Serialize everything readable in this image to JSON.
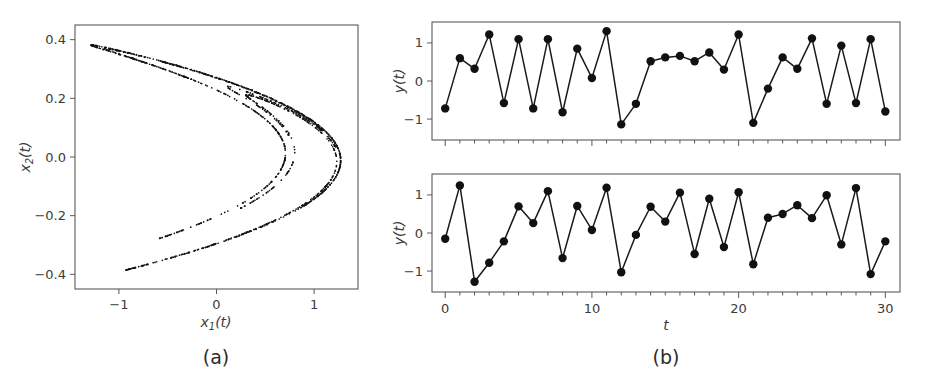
{
  "figure": {
    "background_color": "#ffffff",
    "foreground_color": "#262626",
    "width": 940,
    "height": 378
  },
  "panels": [
    {
      "id": "panel-a",
      "caption": "(a)",
      "type": "scatter",
      "xlabel": "x₁(t)",
      "xlabel_base": "x",
      "xlabel_sub": "1",
      "xlabel_tail": "(t)",
      "ylabel": "x₂(t)",
      "ylabel_base": "x",
      "ylabel_sub": "2",
      "ylabel_tail": "(t)",
      "xticks": [
        -1,
        0,
        1
      ],
      "xtick_labels": [
        "−1",
        "0",
        "1"
      ],
      "yticks": [
        0.4,
        0.2,
        0.0,
        -0.2,
        -0.4
      ],
      "ytick_labels": [
        "0.4",
        "0.2",
        "0.0",
        "−0.2",
        "−0.4"
      ],
      "xlim": [
        -1.45,
        1.45
      ],
      "ylim": [
        -0.45,
        0.45
      ],
      "grid": false,
      "marker": "point",
      "marker_color": "#141414"
    },
    {
      "id": "panel-b",
      "caption": "(b)",
      "type": "line",
      "xlabel": "t",
      "ylabel": "y(t)",
      "xticks": [
        0,
        10,
        20,
        30
      ],
      "xtick_labels": [
        "0",
        "10",
        "20",
        "30"
      ],
      "minor_xticks_every": 1,
      "yticks": [
        1,
        0,
        -1
      ],
      "ytick_labels": [
        "1",
        "0",
        "−1"
      ],
      "xlim": [
        -0.9,
        31.0
      ],
      "ylim": [
        -1.55,
        1.55
      ],
      "grid": false,
      "marker": "circle",
      "marker_color": "#111111",
      "line_color": "#1a1a1a"
    }
  ],
  "chart_data": [
    {
      "type": "scatter",
      "id": "henon-attractor",
      "title": "",
      "panel": "(a)",
      "xlabel": "x_1(t)",
      "ylabel": "x_2(t)",
      "xlim": [
        -1.45,
        1.45
      ],
      "ylim": [
        -0.45,
        0.45
      ],
      "xticks": [
        -1,
        0,
        1
      ],
      "yticks": [
        0.4,
        0.2,
        0.0,
        -0.2,
        -0.4
      ],
      "grid": false,
      "description": "Henon-map chaotic attractor, sideways parabola opening to the left with characteristic folded fractal bands",
      "n_points": 1400,
      "generator": {
        "map": "henon",
        "a": 1.4,
        "b": 0.3,
        "x_scale": 1.0,
        "y_scale": 0.3
      }
    },
    {
      "type": "line",
      "id": "timeseries-top",
      "panel": "(b) top",
      "xlabel": "",
      "ylabel": "y(t)",
      "xlim": [
        -0.9,
        31.0
      ],
      "ylim": [
        -1.55,
        1.55
      ],
      "xticks": [
        0,
        10,
        20,
        30
      ],
      "yticks": [
        1,
        0,
        -1
      ],
      "grid": false,
      "x": [
        0,
        1,
        2,
        3,
        4,
        5,
        6,
        7,
        8,
        9,
        10,
        11,
        12,
        13,
        14,
        15,
        16,
        17,
        18,
        19,
        20,
        21,
        22,
        23,
        24,
        25,
        26,
        27,
        28,
        29,
        30
      ],
      "values": [
        -0.72,
        0.6,
        0.32,
        1.22,
        -0.58,
        1.1,
        -0.72,
        1.1,
        -0.82,
        0.85,
        0.08,
        1.31,
        -1.14,
        -0.6,
        0.52,
        0.62,
        0.66,
        0.52,
        0.75,
        0.3,
        1.22,
        -1.1,
        -0.2,
        0.62,
        0.32,
        1.12,
        -0.6,
        0.93,
        -0.58,
        1.1,
        -0.8
      ]
    },
    {
      "type": "line",
      "id": "timeseries-bottom",
      "panel": "(b) bottom",
      "xlabel": "t",
      "ylabel": "y(t)",
      "xlim": [
        -0.9,
        31.0
      ],
      "ylim": [
        -1.55,
        1.55
      ],
      "xticks": [
        0,
        10,
        20,
        30
      ],
      "yticks": [
        1,
        0,
        -1
      ],
      "grid": false,
      "x": [
        0,
        1,
        2,
        3,
        4,
        5,
        6,
        7,
        8,
        9,
        10,
        11,
        12,
        13,
        14,
        15,
        16,
        17,
        18,
        19,
        20,
        21,
        22,
        23,
        24,
        25,
        26,
        27,
        28,
        29,
        30
      ],
      "values": [
        -0.15,
        1.25,
        -1.28,
        -0.78,
        -0.22,
        0.7,
        0.26,
        1.1,
        -0.66,
        0.71,
        0.08,
        1.19,
        -1.03,
        -0.05,
        0.69,
        0.3,
        1.06,
        -0.55,
        0.9,
        -0.37,
        1.07,
        -0.82,
        0.4,
        0.5,
        0.73,
        0.39,
        0.99,
        -0.3,
        1.18,
        -1.08,
        -0.22
      ]
    }
  ]
}
